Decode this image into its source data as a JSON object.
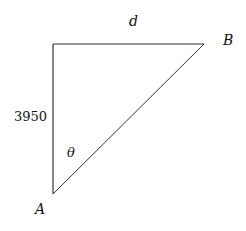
{
  "diagram": {
    "type": "right-triangle",
    "vertices": {
      "A": {
        "label": "A",
        "x": 53,
        "y": 194
      },
      "B": {
        "label": "B",
        "x": 204,
        "y": 44
      },
      "C": {
        "label": "",
        "x": 53,
        "y": 44
      }
    },
    "edges": [
      {
        "from": "C",
        "to": "B",
        "label": "d"
      },
      {
        "from": "C",
        "to": "A",
        "label": "3950"
      },
      {
        "from": "A",
        "to": "B",
        "label": ""
      }
    ],
    "angle": {
      "at": "A",
      "label": "θ"
    },
    "stroke_color": "#333333"
  },
  "labels": {
    "top_edge": "d",
    "left_edge": "3950",
    "angle": "θ",
    "vertex_a": "A",
    "vertex_b": "B"
  }
}
